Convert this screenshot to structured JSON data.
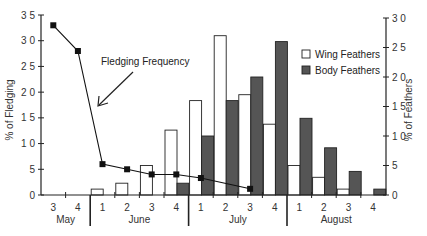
{
  "chart_data": {
    "type": "bar",
    "title": "",
    "xlabel": "",
    "categories": [
      "May 3",
      "May 4",
      "June 1",
      "June 2",
      "June 3",
      "June 4",
      "July 1",
      "July 2",
      "July 3",
      "July 4",
      "August 1",
      "August 2",
      "August 3",
      "August 4"
    ],
    "week_labels": [
      "3",
      "4",
      "1",
      "2",
      "3",
      "4",
      "1",
      "2",
      "3",
      "4",
      "1",
      "2",
      "3",
      "4"
    ],
    "months": [
      {
        "label": "May",
        "weeks": 2
      },
      {
        "label": "June",
        "weeks": 4
      },
      {
        "label": "July",
        "weeks": 4
      },
      {
        "label": "August",
        "weeks": 4
      }
    ],
    "left_axis": {
      "label": "% of Fledging",
      "ylim": [
        0,
        35
      ],
      "ticks": [
        0,
        5,
        10,
        15,
        20,
        25,
        30,
        35
      ],
      "tick_labels": [
        "0",
        "5",
        "1 0",
        "1 5",
        "2 0",
        "2 5",
        "3 0",
        "3 5"
      ]
    },
    "right_axis": {
      "label": "% of Feathers",
      "ylim": [
        0,
        30
      ],
      "ticks": [
        0,
        5,
        10,
        15,
        20,
        25,
        30
      ],
      "tick_labels": [
        "0",
        "5",
        "1 0",
        "1 5",
        "2 0",
        "2 5",
        "3 0"
      ]
    },
    "series": [
      {
        "name": "Wing Feathers",
        "kind": "bar",
        "axis": "right",
        "fill": "#ffffff",
        "values": [
          null,
          null,
          1,
          2,
          5,
          11,
          16,
          27,
          17,
          12,
          5,
          3,
          1,
          null
        ]
      },
      {
        "name": "Body Feathers",
        "kind": "bar",
        "axis": "right",
        "fill": "#555555",
        "values": [
          null,
          null,
          null,
          null,
          null,
          2,
          10,
          16,
          20,
          26,
          13,
          8,
          4,
          1
        ]
      },
      {
        "name": "Fledging Frequency",
        "kind": "line",
        "axis": "left",
        "marker": "square",
        "values": [
          33,
          28,
          6,
          5,
          4,
          4,
          3.3,
          null,
          1.2,
          null,
          null,
          null,
          null,
          null
        ]
      }
    ],
    "legend": {
      "position": "upper right",
      "entries": [
        "Wing Feathers",
        "Body Feathers"
      ]
    },
    "annotations": [
      {
        "text": "Fledging Frequency",
        "arrow_to": "line near June 1"
      }
    ],
    "grid": false
  },
  "labels": {
    "annotation": "Fledging Frequency",
    "legend_wing": "Wing Feathers",
    "legend_body": "Body Feathers",
    "left_axis_title": "% of Fledging",
    "right_axis_title": "% of Feathers"
  },
  "colors": {
    "axis": "#222222",
    "wing_fill": "#ffffff",
    "body_fill": "#555555",
    "line": "#111111"
  }
}
